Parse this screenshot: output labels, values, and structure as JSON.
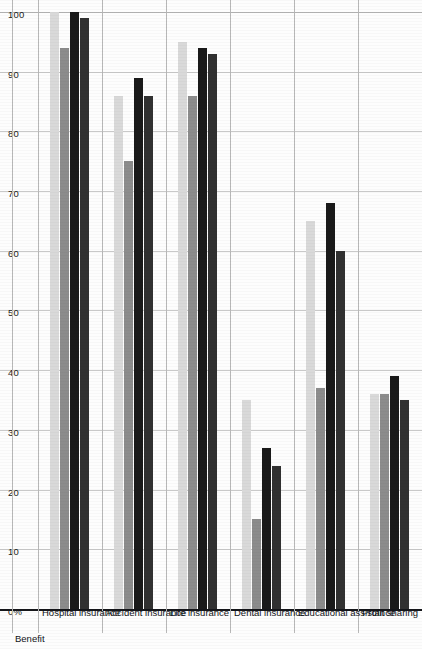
{
  "chart_data": {
    "type": "bar",
    "title": "",
    "subtitle": "",
    "orientation": "horizontal",
    "xlabel": "",
    "ylabel": "Benefit",
    "axis_header": "Benefit",
    "xlim": [
      0,
      100
    ],
    "grid": true,
    "legend_position": "none",
    "tick_labels": [
      "0%",
      "10",
      "20",
      "30",
      "40",
      "50",
      "60",
      "70",
      "80",
      "90",
      "100"
    ],
    "ticks": [
      0,
      10,
      20,
      30,
      40,
      50,
      60,
      70,
      80,
      90,
      100
    ],
    "categories": [
      "Hospital insurance",
      "Accident insurance",
      "Life insurance",
      "Dental insurance",
      "Educational assistance",
      "Profit sharing"
    ],
    "series": [
      {
        "name": "Series 1",
        "color": "#d9d9d9",
        "values": [
          100,
          86,
          95,
          35,
          65,
          36
        ]
      },
      {
        "name": "Series 2",
        "color": "#8c8c8c",
        "values": [
          94,
          75,
          86,
          15,
          37,
          36
        ]
      },
      {
        "name": "Series 3",
        "color": "#1a1a1a",
        "values": [
          100,
          89,
          94,
          27,
          68,
          39
        ]
      },
      {
        "name": "Series 4",
        "color": "#313131",
        "values": [
          99,
          86,
          93,
          24,
          60,
          35
        ]
      }
    ]
  },
  "colors": {
    "axis": "#15161a",
    "gridline": "#c9c9c9",
    "background": "#fdfdfd",
    "text": "#111317"
  }
}
